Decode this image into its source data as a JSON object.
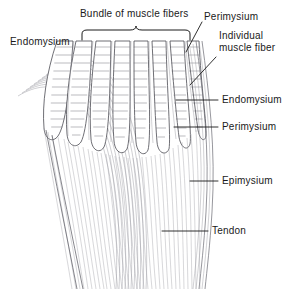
{
  "figure": {
    "title_implicit": "Skeletal muscle organization",
    "background_color": "#ffffff",
    "ink_color": "#1a1a1a",
    "line_color": "#4a4a52",
    "fine_line_color": "#9a9aa2"
  },
  "labels": [
    {
      "id": "bundle",
      "text": "Bundle of muscle fibers",
      "x": 80,
      "y": 8,
      "anchor": "top-center",
      "has_bracket": true
    },
    {
      "id": "endomysium-left",
      "text": "Endomysium",
      "x": 10,
      "y": 36,
      "anchor": "left",
      "has_bracket": false
    },
    {
      "id": "perimysium-top",
      "text": "Perimysium",
      "x": 204,
      "y": 11,
      "anchor": "left",
      "has_bracket": false
    },
    {
      "id": "individual-fiber",
      "text": "Individual\nmuscle fiber",
      "x": 218,
      "y": 30,
      "anchor": "left",
      "has_bracket": false
    },
    {
      "id": "endomysium-right",
      "text": "Endomysium",
      "x": 222,
      "y": 95,
      "anchor": "left",
      "has_bracket": false
    },
    {
      "id": "perimysium-right",
      "text": "Perimysium",
      "x": 222,
      "y": 122,
      "anchor": "left",
      "has_bracket": false
    },
    {
      "id": "epimysium",
      "text": "Epimysium",
      "x": 222,
      "y": 176,
      "anchor": "left",
      "has_bracket": false
    },
    {
      "id": "tendon",
      "text": "Tendon",
      "x": 212,
      "y": 226,
      "anchor": "left",
      "has_bracket": false
    }
  ],
  "label_text": {
    "bundle": "Bundle of muscle fibers",
    "endomysium_left": "Endomysium",
    "perimysium_top": "Perimysium",
    "individual_fiber_line1": "Individual",
    "individual_fiber_line2": "muscle fiber",
    "endomysium_right": "Endomysium",
    "perimysium_right": "Perimysium",
    "epimysium": "Epimysium",
    "tendon": "Tendon"
  },
  "bracket": {
    "left_x": 82,
    "right_x": 190,
    "base_y": 40,
    "peak_x": 136,
    "peak_y": 26
  },
  "leaders": [
    {
      "id": "perimysium-top-leader",
      "x1": 202,
      "y1": 22,
      "x2": 186,
      "y2": 52
    },
    {
      "id": "individual-fiber-leader",
      "x1": 216,
      "y1": 56,
      "x2": 190,
      "y2": 84
    },
    {
      "id": "endomysium-right-leader",
      "x1": 218,
      "y1": 100,
      "x2": 178,
      "y2": 100
    },
    {
      "id": "perimysium-right-leader",
      "x1": 218,
      "y1": 127,
      "x2": 176,
      "y2": 127
    },
    {
      "id": "epimysium-leader",
      "x1": 218,
      "y1": 181,
      "x2": 190,
      "y2": 181
    },
    {
      "id": "tendon-leader",
      "x1": 208,
      "y1": 231,
      "x2": 165,
      "y2": 231
    }
  ],
  "structure": {
    "fiber_bundle_count": 11,
    "fan_apex_x": 147,
    "fan_apex_y": 300,
    "muscle_top_y": 40,
    "tendon_bottom_y": 286,
    "description": "Fan of striated muscle fibers tapering into a converging tendon"
  }
}
